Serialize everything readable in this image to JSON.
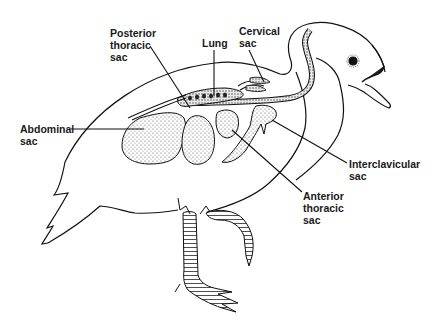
{
  "diagram": {
    "labels": [
      {
        "id": "posterior-thoracic-sac",
        "lines": [
          "Posterior",
          "thoracic",
          "sac"
        ]
      },
      {
        "id": "lung",
        "lines": [
          "Lung"
        ]
      },
      {
        "id": "cervical-sac",
        "lines": [
          "Cervical",
          "sac"
        ]
      },
      {
        "id": "abdominal-sac",
        "lines": [
          "Abdominal",
          "sac"
        ]
      },
      {
        "id": "interclavicular-sac",
        "lines": [
          "Interclavicular",
          "sac"
        ]
      },
      {
        "id": "anterior-thoracic-sac",
        "lines": [
          "Anterior",
          "thoracic",
          "sac"
        ]
      }
    ],
    "colors": {
      "line": "#111111",
      "background": "#ffffff",
      "stipple": "#9a9a9a"
    }
  }
}
